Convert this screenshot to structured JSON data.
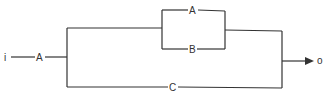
{
  "diagram": {
    "type": "block-diagram",
    "input_label": "i",
    "output_label": "o",
    "blocks": {
      "series_input": "A",
      "parallel_top": "A",
      "parallel_bottom": "B",
      "bypass": "C"
    },
    "colors": {
      "line": "#333333",
      "background": "#ffffff"
    }
  }
}
